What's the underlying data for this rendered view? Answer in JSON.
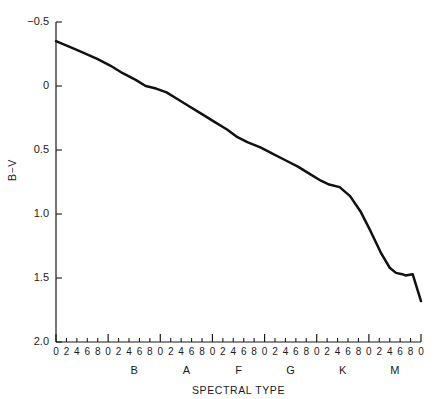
{
  "chart_data": {
    "type": "line",
    "title": "",
    "xlabel": "SPECTRAL TYPE",
    "ylabel": "B−V",
    "ylim": [
      -0.5,
      2.0
    ],
    "y_inverted": true,
    "grid": false,
    "legend": null,
    "y_ticks": [
      {
        "value": -0.5,
        "label": "−0.5"
      },
      {
        "value": 0.0,
        "label": "0"
      },
      {
        "value": 0.5,
        "label": "0.5"
      },
      {
        "value": 1.0,
        "label": "1.0"
      },
      {
        "value": 1.5,
        "label": "1.5"
      },
      {
        "value": 2.0,
        "label": "2.0"
      }
    ],
    "x_classes": [
      {
        "label": "B",
        "show_label": false,
        "index": 0
      },
      {
        "label": "B",
        "show_label": true,
        "index": 1
      },
      {
        "label": "A",
        "show_label": true,
        "index": 2
      },
      {
        "label": "F",
        "show_label": true,
        "index": 3
      },
      {
        "label": "G",
        "show_label": true,
        "index": 4
      },
      {
        "label": "K",
        "show_label": true,
        "index": 5
      },
      {
        "label": "M",
        "show_label": true,
        "index": 6
      }
    ],
    "x_subtick_labels": [
      "0",
      "2",
      "4",
      "6",
      "8"
    ],
    "x_final_tick_label": "0",
    "x_tick_sequence": [
      "0",
      "2",
      "4",
      "6",
      "8",
      "0",
      "2",
      "4",
      "6",
      "8",
      "0",
      "2",
      "4",
      "6",
      "8",
      "0",
      "2",
      "4",
      "6",
      "8",
      "0",
      "2",
      "4",
      "6",
      "8",
      "0",
      "2",
      "4",
      "6",
      "8",
      "0",
      "2",
      "4",
      "6",
      "8",
      "0"
    ],
    "x_class_label_sequence": [
      "B",
      "A",
      "F",
      "G",
      "K",
      "M"
    ],
    "x_units_total": 35,
    "x": [
      0.0,
      1.0,
      2.0,
      3.0,
      4.0,
      5.0,
      6.0,
      7.0,
      8.0,
      9.0,
      10.0,
      11.0,
      12.0,
      13.0,
      14.0,
      15.0,
      16.0,
      17.0,
      18.0,
      19.0,
      20.0,
      21.0,
      22.0,
      23.0,
      24.0,
      25.0,
      26.0,
      27.0,
      28.0,
      29.0,
      30.0,
      31.0,
      32.0,
      33.0,
      33.6
    ],
    "values": [
      -0.35,
      -0.3,
      -0.26,
      -0.22,
      -0.18,
      -0.14,
      -0.09,
      -0.04,
      0.0,
      0.02,
      0.04,
      0.09,
      0.14,
      0.18,
      0.22,
      0.26,
      0.31,
      0.36,
      0.41,
      0.45,
      0.49,
      0.53,
      0.58,
      0.62,
      0.66,
      0.72,
      0.77,
      0.78,
      0.82,
      0.95,
      1.12,
      1.28,
      1.42,
      1.48,
      1.68
    ],
    "series": [
      {
        "name": "main-sequence B−V color",
        "points": [
          {
            "x": 0.0,
            "y": -0.35
          },
          {
            "x": 1.2,
            "y": -0.31
          },
          {
            "x": 2.6,
            "y": -0.26
          },
          {
            "x": 4.0,
            "y": -0.21
          },
          {
            "x": 5.2,
            "y": -0.16
          },
          {
            "x": 6.4,
            "y": -0.1
          },
          {
            "x": 7.6,
            "y": -0.05
          },
          {
            "x": 8.6,
            "y": 0.0
          },
          {
            "x": 9.6,
            "y": 0.02
          },
          {
            "x": 10.6,
            "y": 0.05
          },
          {
            "x": 11.6,
            "y": 0.1
          },
          {
            "x": 12.8,
            "y": 0.16
          },
          {
            "x": 14.0,
            "y": 0.22
          },
          {
            "x": 15.2,
            "y": 0.28
          },
          {
            "x": 16.4,
            "y": 0.34
          },
          {
            "x": 17.4,
            "y": 0.4
          },
          {
            "x": 18.4,
            "y": 0.44
          },
          {
            "x": 19.6,
            "y": 0.48
          },
          {
            "x": 20.8,
            "y": 0.53
          },
          {
            "x": 22.0,
            "y": 0.58
          },
          {
            "x": 23.2,
            "y": 0.63
          },
          {
            "x": 24.4,
            "y": 0.69
          },
          {
            "x": 25.4,
            "y": 0.74
          },
          {
            "x": 26.2,
            "y": 0.77
          },
          {
            "x": 27.2,
            "y": 0.79
          },
          {
            "x": 28.2,
            "y": 0.86
          },
          {
            "x": 29.2,
            "y": 0.98
          },
          {
            "x": 30.2,
            "y": 1.14
          },
          {
            "x": 31.2,
            "y": 1.31
          },
          {
            "x": 32.0,
            "y": 1.42
          },
          {
            "x": 32.6,
            "y": 1.46
          },
          {
            "x": 33.2,
            "y": 1.47
          },
          {
            "x": 33.5,
            "y": 1.48
          },
          {
            "x": 34.2,
            "y": 1.47
          },
          {
            "x": 35.0,
            "y": 1.68
          }
        ]
      }
    ]
  },
  "plot_geometry": {
    "left": 56,
    "right": 421,
    "top": 22,
    "bottom": 342
  },
  "colors": {
    "curve": "#111111",
    "axis": "#1a1a1a",
    "background": "#ffffff",
    "text": "#1a1a1a"
  }
}
